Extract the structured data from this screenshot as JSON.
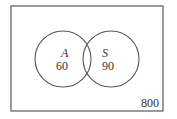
{
  "diagram": {
    "type": "venn",
    "universe": {
      "label": "800",
      "x": 11,
      "y": 6,
      "width": 152,
      "height": 105
    },
    "sets": [
      {
        "name": "A",
        "value": "60",
        "cx": 63,
        "cy": 59,
        "r": 28
      },
      {
        "name": "S",
        "value": "90",
        "cx": 111,
        "cy": 59,
        "r": 28
      }
    ],
    "intersection": {
      "value": ""
    },
    "colors": {
      "stroke": "#555555",
      "text": "#333333",
      "background": "#ffffff"
    }
  }
}
